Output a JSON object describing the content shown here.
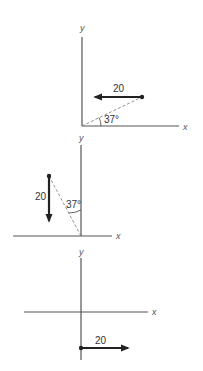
{
  "diagrams": [
    {
      "id": "diagram-1",
      "axis_x_label": "x",
      "axis_y_label": "y",
      "vector_magnitude": "20",
      "vector_direction": "-x",
      "angle_label": "37°",
      "angle_reference": "x-axis"
    },
    {
      "id": "diagram-2",
      "axis_x_label": "x",
      "axis_y_label": "y",
      "vector_magnitude": "20",
      "vector_direction": "-y",
      "angle_label": "37°",
      "angle_reference": "y-axis"
    },
    {
      "id": "diagram-3",
      "axis_x_label": "x",
      "axis_y_label": "y",
      "vector_magnitude": "20",
      "vector_direction": "+x"
    }
  ]
}
